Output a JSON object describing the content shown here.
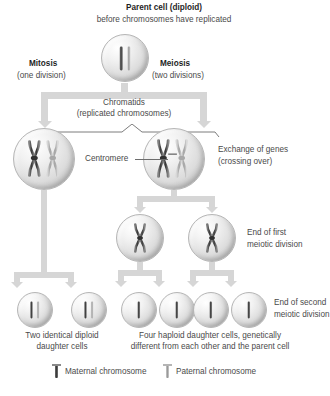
{
  "diagram": {
    "colors": {
      "maternal_chromosome": "#4a4a4a",
      "paternal_chromosome": "#b3b3b3",
      "arrow": "#d6d6d6",
      "cell_fill": "#e2e2e2",
      "text": "#4a4a4a"
    }
  },
  "header": {
    "parent_cell_title": "Parent cell (diploid)",
    "parent_cell_subtitle": "before chromosomes have replicated"
  },
  "branches": {
    "mitosis": {
      "label": "Mitosis",
      "sublabel": "(one division)"
    },
    "meiosis": {
      "label": "Meiosis",
      "sublabel": "(two divisions)"
    }
  },
  "callouts": {
    "chromatids_title": "Chromatids",
    "chromatids_subtitle": "(replicated chromosomes)",
    "centromere": "Centromere",
    "crossing_over_line1": "Exchange of genes",
    "crossing_over_line2": "(crossing over)",
    "end_first_line1": "End of first",
    "end_first_line2": "meiotic division",
    "end_second_line1": "End of second",
    "end_second_line2": "meiotic division"
  },
  "captions": {
    "mitosis_result_line1": "Two identical diploid",
    "mitosis_result_line2": "daughter cells",
    "meiosis_result_line1": "Four haploid daughter cells, genetically",
    "meiosis_result_line2": "different from each other and the parent cell"
  },
  "legend": {
    "items": [
      {
        "label": "Maternal chromosome",
        "icon": "chromosome-dark-icon",
        "color": "#4a4a4a"
      },
      {
        "label": "Paternal chromosome",
        "icon": "chromosome-light-icon",
        "color": "#b3b3b3"
      }
    ]
  },
  "cells": [
    {
      "id": "parent",
      "stage": "parent-cell",
      "chromosomes": 2,
      "shape": "rod",
      "ploidy": "diploid"
    },
    {
      "id": "mitosis-replicated",
      "stage": "replicated",
      "chromosomes": 2,
      "shape": "x",
      "ploidy": "diploid"
    },
    {
      "id": "meiosis-replicated",
      "stage": "replicated-crossing-over",
      "chromosomes": 2,
      "shape": "x",
      "ploidy": "diploid"
    },
    {
      "id": "meiosis-1-left",
      "stage": "end-of-first-meiotic-division",
      "chromosomes": 1,
      "shape": "x",
      "ploidy": "haploid"
    },
    {
      "id": "meiosis-1-right",
      "stage": "end-of-first-meiotic-division",
      "chromosomes": 1,
      "shape": "x",
      "ploidy": "haploid"
    },
    {
      "id": "mitosis-daughter-1",
      "stage": "daughter",
      "chromosomes": 2,
      "shape": "rod",
      "ploidy": "diploid"
    },
    {
      "id": "mitosis-daughter-2",
      "stage": "daughter",
      "chromosomes": 2,
      "shape": "rod",
      "ploidy": "diploid"
    },
    {
      "id": "meiosis-daughter-1",
      "stage": "daughter",
      "chromosomes": 1,
      "shape": "rod",
      "ploidy": "haploid"
    },
    {
      "id": "meiosis-daughter-2",
      "stage": "daughter",
      "chromosomes": 1,
      "shape": "rod",
      "ploidy": "haploid"
    },
    {
      "id": "meiosis-daughter-3",
      "stage": "daughter",
      "chromosomes": 1,
      "shape": "rod",
      "ploidy": "haploid"
    },
    {
      "id": "meiosis-daughter-4",
      "stage": "daughter",
      "chromosomes": 1,
      "shape": "rod",
      "ploidy": "haploid"
    }
  ]
}
